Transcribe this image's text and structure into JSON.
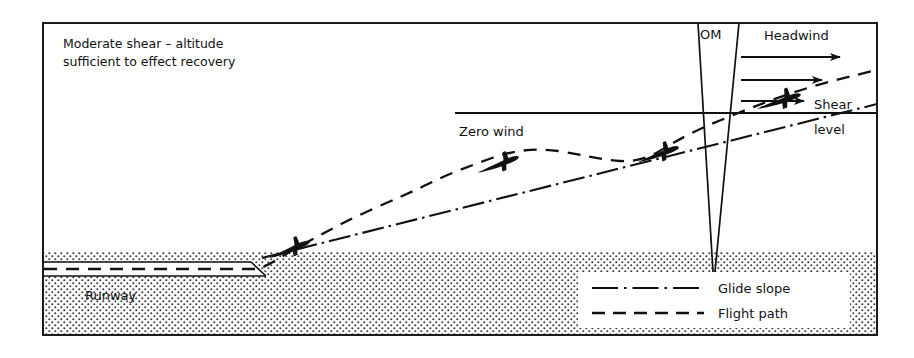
{
  "figure": {
    "type": "diagram",
    "caption_line1": "Moderate shear – altitude",
    "caption_line2": "sufficient to effect recovery"
  },
  "labels": {
    "caption_line1": "Moderate shear – altitude",
    "caption_line2": "sufficient to effect recovery",
    "om": "OM",
    "headwind": "Headwind",
    "shear_line1": "Shear",
    "shear_line2": "level",
    "zero_wind": "Zero wind",
    "runway": "Runway"
  },
  "legend": {
    "items": [
      {
        "label": "Glide slope",
        "style": "dash-dot",
        "icon": "dash-dot-line-icon"
      },
      {
        "label": "Flight path",
        "style": "dashed",
        "icon": "dashed-line-icon"
      }
    ]
  },
  "colors": {
    "ink": "#111111",
    "frame": "#1a1a1a",
    "ground_stipple": "#444444",
    "paper": "#ffffff"
  },
  "geometry": {
    "frame": {
      "x": 42,
      "y": 22,
      "width": 836,
      "height": 314
    },
    "ground_top_y": 252,
    "runway": {
      "x1": 44,
      "x2": 262,
      "top_y": 262,
      "bottom_y": 276
    },
    "shear_level_line": {
      "x1": 455,
      "x2": 876,
      "y": 113
    },
    "om_marker": {
      "apex_x": 713,
      "apex_y": 270,
      "top_y": 24,
      "left_top_x": 698,
      "right_top_x": 738
    },
    "aircraft_positions": [
      {
        "x": 294,
        "y": 247,
        "angle": -17,
        "scale": 1.0
      },
      {
        "x": 503,
        "y": 163,
        "angle": -17,
        "scale": 1.0
      },
      {
        "x": 662,
        "y": 152,
        "angle": -15,
        "scale": 1.0
      },
      {
        "x": 783,
        "y": 99,
        "angle": -14,
        "scale": 1.05
      }
    ],
    "headwind_arrows": [
      {
        "x1": 740,
        "y": 57,
        "x2": 842
      },
      {
        "x1": 740,
        "y": 80,
        "x2": 824
      },
      {
        "x1": 740,
        "y": 100,
        "x2": 806
      }
    ],
    "glide_slope": {
      "start": [
        262,
        258
      ],
      "end": [
        876,
        105
      ]
    },
    "legend_box": {
      "x": 578,
      "y": 272,
      "width": 272,
      "height": 56
    }
  },
  "series": {
    "glide_slope_points": [
      [
        262,
        258
      ],
      [
        876,
        105
      ]
    ],
    "flight_path_points": [
      [
        44,
        269
      ],
      [
        262,
        269
      ],
      [
        300,
        246
      ],
      [
        360,
        225
      ],
      [
        420,
        205
      ],
      [
        460,
        183
      ],
      [
        492,
        170
      ],
      [
        520,
        156
      ],
      [
        556,
        152
      ],
      [
        596,
        160
      ],
      [
        636,
        160
      ],
      [
        668,
        148
      ],
      [
        700,
        130
      ],
      [
        730,
        120
      ],
      [
        762,
        106
      ],
      [
        800,
        96
      ],
      [
        840,
        86
      ],
      [
        876,
        78
      ]
    ]
  }
}
